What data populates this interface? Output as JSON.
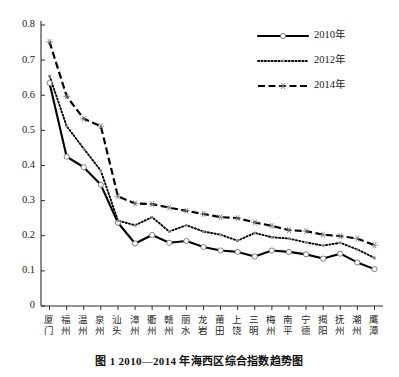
{
  "figure": {
    "caption": "图 1    2010—2014 年海西区综合指数趋势图",
    "caption_number": "图 1",
    "caption_text": "2010—2014 年海西区综合指数趋势图"
  },
  "chart_data": {
    "type": "line",
    "title": "2010—2014 年海西区综合指数趋势图",
    "xlabel": "",
    "ylabel": "",
    "ylim": [
      0,
      0.8
    ],
    "yticks": [
      "0",
      "0.1",
      "0.2",
      "0.3",
      "0.4",
      "0.5",
      "0.6",
      "0.7",
      "0.8"
    ],
    "ytick_values": [
      0,
      0.1,
      0.2,
      0.3,
      0.4,
      0.5,
      0.6,
      0.7,
      0.8
    ],
    "grid": false,
    "legend_position": "top-right",
    "categories": [
      "厦门",
      "福州",
      "温州",
      "泉州",
      "汕头",
      "漳州",
      "衢州",
      "赣州",
      "丽水",
      "龙岩",
      "莆田",
      "上饶",
      "三明",
      "梅州",
      "南平",
      "宁德",
      "揭阳",
      "抚州",
      "潮州",
      "鹰潭"
    ],
    "series": [
      {
        "name": "2010年",
        "style": "solid",
        "marker": "circle",
        "color": "#000000",
        "values": [
          0.635,
          0.425,
          0.395,
          0.345,
          0.237,
          0.178,
          0.202,
          0.18,
          0.185,
          0.168,
          0.158,
          0.154,
          0.141,
          0.158,
          0.154,
          0.147,
          0.135,
          0.149,
          0.124,
          0.105
        ]
      },
      {
        "name": "2012年",
        "style": "dotted",
        "marker": "dot",
        "color": "#000000",
        "values": [
          0.655,
          0.512,
          0.448,
          0.385,
          0.243,
          0.23,
          0.253,
          0.212,
          0.23,
          0.212,
          0.203,
          0.186,
          0.208,
          0.196,
          0.192,
          0.181,
          0.172,
          0.18,
          0.161,
          0.137
        ]
      },
      {
        "name": "2014年",
        "style": "dashed",
        "marker": "star",
        "color": "#000000",
        "values": [
          0.752,
          0.597,
          0.533,
          0.512,
          0.312,
          0.292,
          0.29,
          0.28,
          0.271,
          0.262,
          0.253,
          0.25,
          0.238,
          0.228,
          0.216,
          0.213,
          0.203,
          0.199,
          0.192,
          0.173
        ]
      }
    ]
  },
  "legend": {
    "items": [
      {
        "label": "2010年",
        "style": "solid",
        "marker": "circle"
      },
      {
        "label": "2012年",
        "style": "dotted",
        "marker": "dot"
      },
      {
        "label": "2014年",
        "style": "dashed",
        "marker": "star"
      }
    ]
  }
}
